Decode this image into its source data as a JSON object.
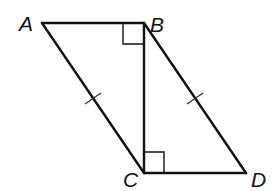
{
  "diagram": {
    "type": "geometry",
    "colors": {
      "stroke": "#111111",
      "background": "#ffffff"
    },
    "vertices": [
      {
        "label": "A",
        "x": 42,
        "y": 23,
        "label_x": 19,
        "label_y": 31
      },
      {
        "label": "B",
        "x": 144,
        "y": 23,
        "label_x": 150,
        "label_y": 32
      },
      {
        "label": "C",
        "x": 144,
        "y": 173,
        "label_x": 123,
        "label_y": 187
      },
      {
        "label": "D",
        "x": 246,
        "y": 173,
        "label_x": 251,
        "label_y": 187
      }
    ],
    "segments": [
      {
        "name": "AB",
        "from": "A",
        "to": "B"
      },
      {
        "name": "BC",
        "from": "B",
        "to": "C"
      },
      {
        "name": "AC",
        "from": "A",
        "to": "C",
        "tick_marks": 1
      },
      {
        "name": "BD",
        "from": "B",
        "to": "D",
        "tick_marks": 1
      },
      {
        "name": "CD",
        "from": "C",
        "to": "D"
      }
    ],
    "right_angles": [
      {
        "at": "B",
        "between": [
          "A",
          "C"
        ]
      },
      {
        "at": "C",
        "between": [
          "B",
          "D"
        ]
      }
    ],
    "congruent_segments": [
      [
        "AC",
        "BD"
      ]
    ]
  }
}
